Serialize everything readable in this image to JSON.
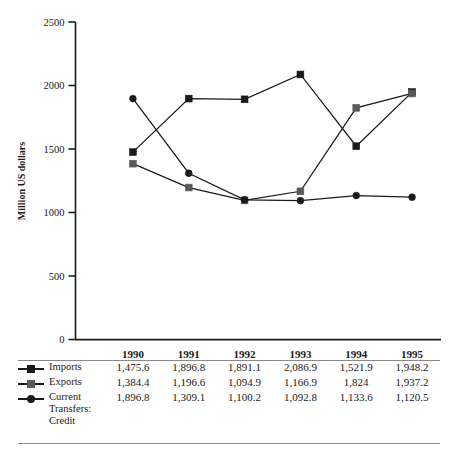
{
  "chart_data": {
    "type": "line",
    "title": "",
    "xlabel": "",
    "ylabel": "Million US dollars",
    "categories": [
      "1990",
      "1991",
      "1992",
      "1993",
      "1994",
      "1995"
    ],
    "ylim": [
      0,
      2500
    ],
    "yticks": [
      0,
      500,
      1000,
      1500,
      2000,
      2500
    ],
    "ytick_labels": [
      "0",
      "500",
      "1000",
      "1500",
      "2000",
      "2500"
    ],
    "grid": false,
    "legend_position": "table-left",
    "series": [
      {
        "name": "Imports",
        "marker": "square",
        "color": "#1a1a1a",
        "values": [
          1475.6,
          1896.8,
          1891.1,
          2086.9,
          1521.9,
          1948.2
        ],
        "display_values": [
          "1,475.6",
          "1,896.8",
          "1,891.1",
          "2,086.9",
          "1,521.9",
          "1,948.2"
        ]
      },
      {
        "name": "Exports",
        "marker": "square",
        "color": "#5a5a5a",
        "values": [
          1384.4,
          1196.6,
          1094.9,
          1166.9,
          1824,
          1937.2
        ],
        "display_values": [
          "1,384.4",
          "1,196.6",
          "1,094.9",
          "1,166.9",
          "1,824",
          "1,937.2"
        ]
      },
      {
        "name": "Current Transfers: Credit",
        "marker": "circle",
        "color": "#1a1a1a",
        "values": [
          1896.8,
          1309.1,
          1100.2,
          1092.8,
          1133.6,
          1120.5
        ],
        "display_values": [
          "1,896.8",
          "1,309.1",
          "1,100.2",
          "1,092.8",
          "1,133.6",
          "1,120.5"
        ]
      }
    ]
  },
  "table": {
    "corner_label": "",
    "column_headers": [
      "1990",
      "1991",
      "1992",
      "1993",
      "1994",
      "1995"
    ],
    "rows": [
      {
        "label": "Imports",
        "marker": "square-black",
        "cells": [
          "1,475.6",
          "1,896.8",
          "1,891.1",
          "2,086.9",
          "1,521.9",
          "1,948.2"
        ]
      },
      {
        "label": "Exports",
        "marker": "square-gray",
        "cells": [
          "1,384.4",
          "1,196.6",
          "1,094.9",
          "1,166.9",
          "1,824",
          "1,937.2"
        ]
      },
      {
        "label": "Current Transfers: Credit",
        "marker": "circle-black",
        "cells": [
          "1,896.8",
          "1,309.1",
          "1,100.2",
          "1,092.8",
          "1,133.6",
          "1,120.5"
        ]
      }
    ]
  },
  "colors": {
    "imports": "#1a1a1a",
    "exports": "#5a5a5a",
    "current_transfers": "#1a1a1a",
    "axis": "#1a1a1a",
    "rule": "#8a8a8a"
  }
}
